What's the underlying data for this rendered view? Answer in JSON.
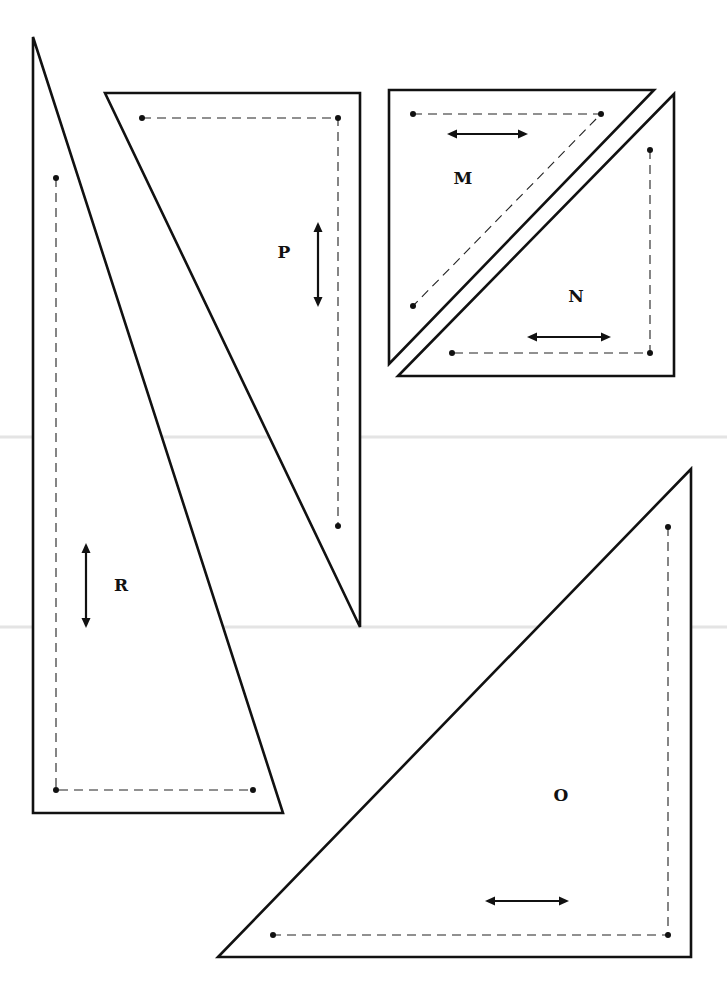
{
  "page": {
    "width": 727,
    "height": 987,
    "background": "#ffffff",
    "line_color": "#111111",
    "fold_lines_y": [
      437,
      627
    ]
  },
  "pieces": [
    {
      "id": "R",
      "label": "R",
      "label_pos": [
        121,
        591
      ],
      "outer": [
        [
          33,
          37
        ],
        [
          33,
          813
        ],
        [
          283,
          813
        ]
      ],
      "seam": [
        [
          56,
          178
        ],
        [
          56,
          790
        ],
        [
          253,
          790
        ]
      ],
      "grain": {
        "orientation": "vertical",
        "from": [
          86,
          543
        ],
        "to": [
          86,
          628
        ]
      }
    },
    {
      "id": "P",
      "label": "P",
      "label_pos": [
        284,
        258
      ],
      "outer": [
        [
          105,
          93
        ],
        [
          360,
          93
        ],
        [
          360,
          627
        ]
      ],
      "seam": [
        [
          142,
          118
        ],
        [
          338,
          118
        ],
        [
          338,
          526
        ]
      ],
      "grain": {
        "orientation": "vertical",
        "from": [
          318,
          222
        ],
        "to": [
          318,
          307
        ]
      }
    },
    {
      "id": "M",
      "label": "M",
      "label_pos": [
        463,
        184
      ],
      "outer": [
        [
          389,
          90
        ],
        [
          654,
          90
        ],
        [
          389,
          364
        ]
      ],
      "seam": [
        [
          413,
          114
        ],
        [
          601,
          114
        ],
        [
          413,
          306
        ]
      ],
      "grain": {
        "orientation": "horizontal",
        "from": [
          447,
          134
        ],
        "to": [
          528,
          134
        ]
      }
    },
    {
      "id": "N",
      "label": "N",
      "label_pos": [
        576,
        302
      ],
      "outer": [
        [
          674,
          94
        ],
        [
          674,
          376
        ],
        [
          398,
          376
        ]
      ],
      "seam": [
        [
          650,
          150
        ],
        [
          650,
          353
        ],
        [
          452,
          353
        ]
      ],
      "grain": {
        "orientation": "horizontal",
        "from": [
          527,
          337
        ],
        "to": [
          611,
          337
        ]
      }
    },
    {
      "id": "O",
      "label": "O",
      "label_pos": [
        561,
        801
      ],
      "outer": [
        [
          691,
          469
        ],
        [
          691,
          957
        ],
        [
          218,
          957
        ]
      ],
      "seam": [
        [
          668,
          527
        ],
        [
          668,
          935
        ],
        [
          273,
          935
        ]
      ],
      "grain": {
        "orientation": "horizontal",
        "from": [
          485,
          901
        ],
        "to": [
          569,
          901
        ]
      }
    }
  ]
}
